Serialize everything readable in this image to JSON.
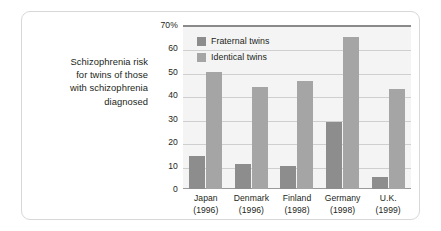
{
  "caption": {
    "lines": [
      "Schizophrenia risk",
      "for twins of those",
      "with schizophrenia",
      "diagnosed"
    ]
  },
  "chart_data": {
    "type": "bar",
    "title": "",
    "xlabel": "",
    "ylabel": "",
    "ylim": [
      0,
      70
    ],
    "grid": true,
    "legend_position": "top-left-inside",
    "categories": [
      "Japan",
      "Denmark",
      "Finland",
      "Germany",
      "U.K."
    ],
    "category_years": [
      "(1996)",
      "(1996)",
      "(1998)",
      "(1998)",
      "(1999)"
    ],
    "y_ticks": [
      "0",
      "10",
      "20",
      "30",
      "40",
      "50",
      "60",
      "70%"
    ],
    "y_tick_values": [
      0,
      10,
      20,
      30,
      40,
      50,
      60,
      70
    ],
    "series": [
      {
        "name": "Fraternal twins",
        "color": "#8d8d8d",
        "values": [
          14,
          10.5,
          10,
          28.5,
          5
        ]
      },
      {
        "name": "Identical twins",
        "color": "#a5a5a5",
        "values": [
          50,
          43.5,
          46,
          65,
          42.5
        ]
      }
    ]
  }
}
